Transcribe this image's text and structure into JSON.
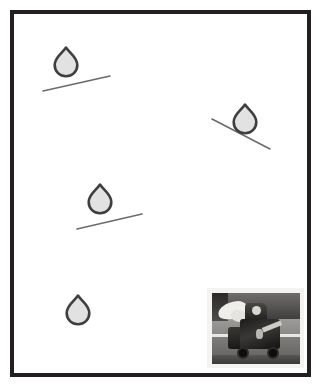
{
  "document": {
    "title": "Framed poster with water drops on inclined surfaces",
    "background_color": "#ffffff",
    "width": 321,
    "height": 385
  },
  "frame": {
    "name": "picture-frame",
    "border_color": "#231f20",
    "border_width": 4,
    "inner_background": "#ffffff",
    "x": 10,
    "y": 10,
    "width": 301,
    "height": 367
  },
  "diagram": {
    "drop_fill_color": "#e2e2e2",
    "drop_outline_color": "#3f3f3f",
    "line_color": "#6b6b6b",
    "drops": [
      {
        "label": "drop-1",
        "cx": 66,
        "cy": 62,
        "width": 23,
        "height": 28,
        "rotation": 0
      },
      {
        "label": "drop-2",
        "cx": 245,
        "cy": 119,
        "width": 23,
        "height": 28,
        "rotation": 0
      },
      {
        "label": "drop-3",
        "cx": 100,
        "cy": 199,
        "width": 23,
        "height": 28,
        "rotation": 0
      },
      {
        "label": "drop-4",
        "cx": 78,
        "cy": 310,
        "width": 23,
        "height": 28,
        "rotation": 0
      }
    ],
    "slope_lines": [
      {
        "label": "slope-line-1",
        "x1": 43,
        "y1": 91,
        "x2": 110,
        "y2": 76,
        "direction": "up-right"
      },
      {
        "label": "slope-line-2",
        "x1": 212,
        "y1": 119,
        "x2": 270,
        "y2": 149,
        "direction": "down-right"
      },
      {
        "label": "slope-line-3",
        "x1": 77,
        "y1": 229,
        "x2": 142,
        "y2": 214,
        "direction": "up-right"
      }
    ]
  },
  "photo_inset": {
    "name": "photo-inset",
    "description": "grayscale photograph of a decorated cart on a road",
    "border_color": "#f3f3f1",
    "x": 207,
    "y": 288,
    "width": 97,
    "height": 80
  }
}
